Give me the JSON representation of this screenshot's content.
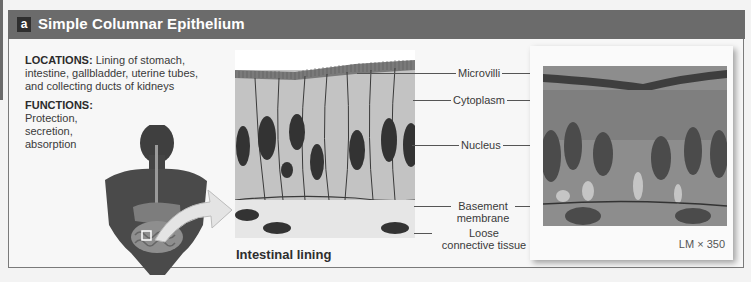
{
  "header": {
    "badge": "a",
    "title": "Simple Columnar Epithelium",
    "bar_color": "#6b6b6b"
  },
  "info": {
    "locations_label": "LOCATIONS:",
    "locations_text": " Lining of stomach, intestine, gallbladder, uterine tubes, and collecting ducts of kidneys",
    "functions_label": "FUNCTIONS:",
    "functions_text": "Protection, secretion, absorption"
  },
  "diagram": {
    "caption": "Intestinal lining"
  },
  "labels": {
    "microvilli": "Microvilli",
    "cytoplasm": "Cytoplasm",
    "nucleus": "Nucleus",
    "basement_1": "Basement",
    "basement_2": "membrane",
    "loose_1": "Loose",
    "loose_2": "connective tissue"
  },
  "micrograph": {
    "magnification": "LM × 350"
  }
}
